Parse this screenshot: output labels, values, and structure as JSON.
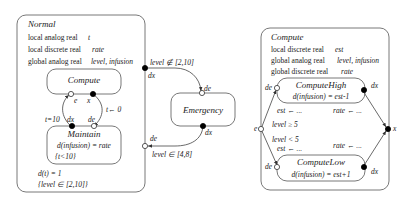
{
  "normal": {
    "title": "Normal",
    "decls": [
      {
        "kind": "local analog real",
        "vars": "t"
      },
      {
        "kind": "local discrete real",
        "vars": "rate"
      },
      {
        "kind": "global analog real",
        "vars": "level, infusion"
      }
    ],
    "compute_label": "Compute",
    "maintain": {
      "title": "Maintain",
      "flow": "d(infusion) = rate",
      "invariant": "{t<10}"
    },
    "ports": {
      "e": "e",
      "x": "x",
      "dx": "dx",
      "de": "de"
    },
    "guard_t": "t=10",
    "reset_t": "t← 0",
    "flow_t": "d(t) = 1",
    "invariant": "{level  ∈ [2,10]}"
  },
  "emergency": {
    "title": "Emergency",
    "guard_in": "level ∉ [2,10]",
    "guard_out": "level ∈ [4,8]",
    "port_dx_top": "dx",
    "port_de_top": "de",
    "port_dx_bottom": "dx",
    "port_de_bottom": "de"
  },
  "compute": {
    "title": "Compute",
    "decls": [
      {
        "kind": "local discrete real",
        "vars": "est"
      },
      {
        "kind": "global analog real",
        "vars": "level, infusion"
      },
      {
        "kind": "global discrete real",
        "vars": "rate"
      }
    ],
    "high": {
      "title": "ComputeHigh",
      "flow": "d(infusion) = est-1"
    },
    "low": {
      "title": "ComputeLow",
      "flow": "d(infusion) = est+1"
    },
    "guard_high": "level ≥ 5",
    "guard_low": "level < 5",
    "assign_est_high": "est ← ...",
    "assign_rate_high": "rate ← ...",
    "assign_est_low": "est ← ...",
    "assign_rate_low": "rate ← ...",
    "port_e": "e",
    "port_x": "x",
    "port_de": "de",
    "port_dx": "dx"
  }
}
